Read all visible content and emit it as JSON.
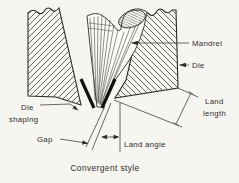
{
  "figure": {
    "caption": "Convergent style",
    "labels": {
      "mandrel": "Mandrel",
      "die": "Die",
      "die_shaping_line1": "Die",
      "die_shaping_line2": "shaping",
      "gap": "Gap",
      "land_length_line1": "Land",
      "land_length_line2": "length",
      "land_angle": "Land angle"
    },
    "colors": {
      "ink": "#2e2d2a",
      "paper": "#f6f5f2"
    }
  }
}
